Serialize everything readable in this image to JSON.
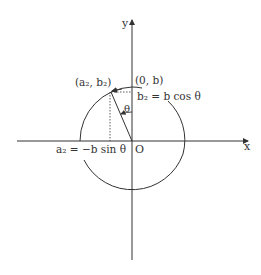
{
  "diagram": {
    "axes": {
      "x_label": "x",
      "y_label": "y",
      "origin_label": "O"
    },
    "labels": {
      "top_point": "(0, b)",
      "rotated_point": "(a₂, b₂)",
      "b2_eq": "b₂ = b cos θ",
      "a2_eq": "a₂ = −b sin θ",
      "angle": "θ"
    },
    "colors": {
      "line": "#333333",
      "background": "#ffffff"
    }
  }
}
